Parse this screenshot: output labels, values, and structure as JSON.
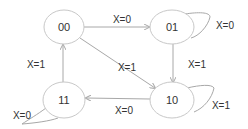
{
  "diagram": {
    "type": "state-machine",
    "states": [
      {
        "id": "00",
        "label": "00"
      },
      {
        "id": "01",
        "label": "01"
      },
      {
        "id": "10",
        "label": "10"
      },
      {
        "id": "11",
        "label": "11"
      }
    ],
    "transitions": [
      {
        "from": "00",
        "to": "01",
        "label": "X=0"
      },
      {
        "from": "01",
        "to": "01",
        "label": "X=0"
      },
      {
        "from": "00",
        "to": "10",
        "label": "X=1"
      },
      {
        "from": "01",
        "to": "10",
        "label": "X=1"
      },
      {
        "from": "10",
        "to": "10",
        "label": "X=1"
      },
      {
        "from": "10",
        "to": "11",
        "label": "X=0"
      },
      {
        "from": "11",
        "to": "00",
        "label": "X=1"
      },
      {
        "from": "11",
        "to": "11",
        "label": "X=0"
      }
    ]
  }
}
